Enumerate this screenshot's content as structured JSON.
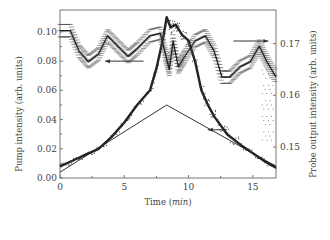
{
  "chart_data": {
    "type": "line",
    "title": "",
    "xlabel": "Time",
    "xlabel_unit": "min",
    "ylabel_left": "Pump intensity (arb. units)",
    "ylabel_right": "Probe output intensity (arb. units)",
    "xlim": [
      0,
      16.8
    ],
    "ylim_left": [
      0.0,
      0.115
    ],
    "ylim_right": [
      0.144,
      0.1765
    ],
    "x_ticks": [
      "0",
      "5",
      "10",
      "15"
    ],
    "y_left_ticks": [
      "0.00",
      "0.02",
      "0.04",
      "0.06",
      "0.08",
      "0.10"
    ],
    "y_right_ticks": [
      "0.15",
      "0.16",
      "0.17"
    ],
    "grid": false,
    "series": [
      {
        "name": "Pump intensity (input ramp)",
        "axis": "left",
        "style": "solid line",
        "x": [
          0,
          8.3,
          16.8
        ],
        "y": [
          0.004,
          0.05,
          0.008
        ]
      },
      {
        "name": "Pump intensity (measured)",
        "axis": "left",
        "style": "dense scatter",
        "x": [
          0,
          1,
          2,
          3,
          4,
          5,
          6,
          7,
          7.5,
          8.0,
          8.3,
          8.6,
          9,
          9.5,
          10,
          10.5,
          11,
          11.5,
          12,
          13,
          14,
          15,
          16,
          16.8
        ],
        "y": [
          0.008,
          0.012,
          0.016,
          0.02,
          0.028,
          0.038,
          0.05,
          0.06,
          0.075,
          0.095,
          0.11,
          0.103,
          0.105,
          0.098,
          0.094,
          0.08,
          0.06,
          0.05,
          0.042,
          0.03,
          0.023,
          0.017,
          0.011,
          0.007
        ]
      },
      {
        "name": "Probe output intensity",
        "axis": "right",
        "style": "line with scatter",
        "x": [
          0,
          0.8,
          1.5,
          2.2,
          3,
          3.7,
          4.5,
          5.3,
          6,
          7,
          7.8,
          8.2,
          8.5,
          8.8,
          9.2,
          9.7,
          10.5,
          11.3,
          12,
          12.6,
          13.2,
          14,
          14.8,
          15.5,
          16.1,
          16.8
        ],
        "y": [
          0.1725,
          0.1725,
          0.1685,
          0.1665,
          0.168,
          0.1715,
          0.1695,
          0.1675,
          0.169,
          0.1715,
          0.172,
          0.168,
          0.165,
          0.1705,
          0.1655,
          0.1675,
          0.1705,
          0.1715,
          0.1685,
          0.1635,
          0.1635,
          0.1655,
          0.1665,
          0.1695,
          0.1665,
          0.1635
        ]
      }
    ],
    "annotations": [
      {
        "type": "arrow",
        "direction": "right",
        "x_range": [
          13.5,
          16.2
        ],
        "y_right": 0.1705,
        "meaning": "probe curve uses right axis"
      },
      {
        "type": "arrow",
        "direction": "left",
        "x_range": [
          3.5,
          6.5
        ],
        "y_left": 0.08,
        "meaning": "measured pump uses left axis"
      },
      {
        "type": "arrow",
        "direction": "left",
        "x_range": [
          11.5,
          13.0
        ],
        "y_left": 0.033,
        "meaning": "input ramp uses left axis"
      }
    ]
  }
}
